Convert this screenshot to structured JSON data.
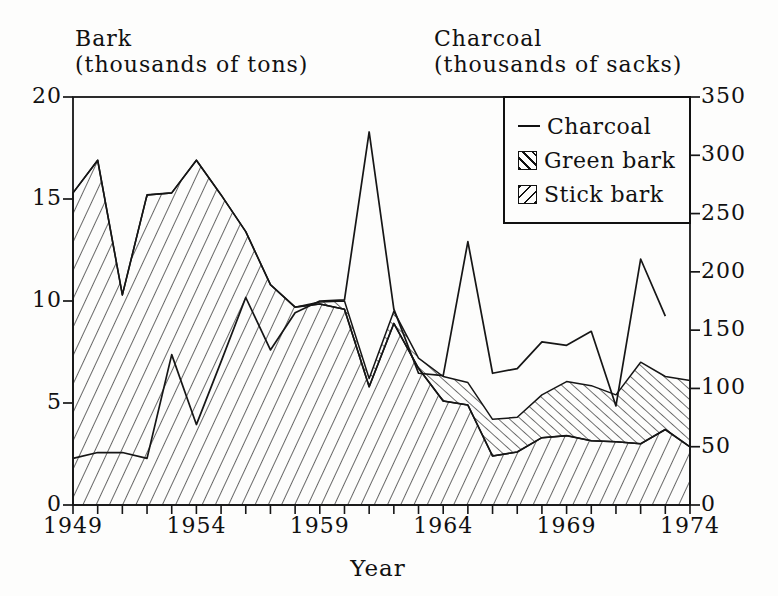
{
  "figure": {
    "left_axis_title_line1": "Bark",
    "left_axis_title_line2": "(thousands of tons)",
    "right_axis_title_line1": "Charcoal",
    "right_axis_title_line2": "(thousands of sacks)",
    "x_axis_label": "Year"
  },
  "legend": {
    "items": [
      {
        "label": "Charcoal",
        "swatch": "line"
      },
      {
        "label": "Green bark",
        "swatch": "hatch-backslash"
      },
      {
        "label": "Stick bark",
        "swatch": "hatch-forward-slash"
      }
    ]
  },
  "chart_data": {
    "type": "area",
    "title": "",
    "xlabel": "Year",
    "x": [
      1949,
      1950,
      1951,
      1952,
      1953,
      1954,
      1955,
      1956,
      1957,
      1958,
      1959,
      1960,
      1961,
      1962,
      1963,
      1964,
      1965,
      1966,
      1967,
      1968,
      1969,
      1970,
      1971,
      1972,
      1973,
      1974
    ],
    "x_labeled_ticks": [
      1949,
      1954,
      1959,
      1964,
      1969,
      1974
    ],
    "stacking": "Stick bark and Green bark are stacked hatched areas on the left axis; Charcoal is a line on the right axis and has no 1974 value",
    "series": [
      {
        "name": "Charcoal",
        "axis": "right",
        "style": "line",
        "values": [
          40,
          45,
          45,
          40,
          129,
          69,
          123,
          178,
          133,
          165,
          175,
          176,
          320,
          168,
          113,
          111,
          226,
          113,
          117,
          140,
          137,
          149,
          85,
          211,
          162,
          null
        ]
      },
      {
        "name": "Green bark",
        "axis": "left",
        "style": "area-hatch-backslash",
        "values": [
          0,
          0,
          0,
          0,
          0,
          0,
          0,
          0,
          0,
          0,
          0.1,
          0.4,
          0.4,
          0.6,
          0.5,
          1.2,
          1.1,
          1.8,
          1.7,
          2.1,
          2.65,
          2.7,
          2.3,
          4.0,
          2.6,
          3.25
        ]
      },
      {
        "name": "Stick bark",
        "axis": "left",
        "style": "area-hatch-slash",
        "values": [
          15.3,
          16.9,
          10.3,
          15.2,
          15.3,
          16.9,
          15.2,
          13.4,
          10.8,
          9.7,
          9.85,
          9.6,
          5.8,
          8.9,
          6.7,
          5.1,
          4.9,
          2.4,
          2.6,
          3.3,
          3.4,
          3.15,
          3.1,
          3.0,
          3.7,
          2.85
        ]
      }
    ],
    "left_axis": {
      "title": "Bark (thousands of tons)",
      "range": [
        0,
        20
      ],
      "ticks": [
        0,
        5,
        10,
        15,
        20
      ]
    },
    "right_axis": {
      "title": "Charcoal (thousands of sacks)",
      "range": [
        0,
        350
      ],
      "ticks": [
        0,
        50,
        100,
        150,
        200,
        250,
        300,
        350
      ]
    },
    "grid": false,
    "legend_position": "top-right-inside"
  }
}
